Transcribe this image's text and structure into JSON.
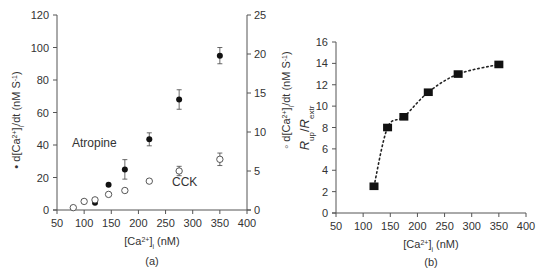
{
  "chart_data": [
    {
      "type": "scatter",
      "panel_label": "(a)",
      "title": "",
      "xlabel": "[Ca2+]i (nM)",
      "xlabel_parts": {
        "pre": "[Ca",
        "sup": "2+",
        "post": "]",
        "sub": "i",
        "unit": " (nM)"
      },
      "ylabel_left": "• d[Ca2+]i/dt (nM S-1)",
      "ylabel_left_parts": {
        "marker": "•",
        "pre": " d[Ca",
        "sup": "2+",
        "post": "]",
        "sub": "i",
        "rest": "/dt (nM S",
        "sup2": "-1",
        "end": ")"
      },
      "ylabel_right": "◦ d[Ca2+]i/dt (nM S-1)",
      "ylabel_right_parts": {
        "marker": "◦",
        "pre": " d[Ca",
        "sup": "2+",
        "post": "]",
        "sub": "i",
        "rest": "/dt (nM S",
        "sup2": "-1",
        "end": ")"
      },
      "xlim": [
        50,
        400
      ],
      "xticks": [
        "50",
        "100",
        "150",
        "200",
        "250",
        "300",
        "350",
        "400"
      ],
      "ylim_left": [
        0,
        120
      ],
      "yticks_left": [
        "0",
        "20",
        "40",
        "60",
        "80",
        "100",
        "120"
      ],
      "ylim_right": [
        0,
        25
      ],
      "yticks_right": [
        "0",
        "5",
        "10",
        "15",
        "20",
        "25"
      ],
      "grid": false,
      "annotations": [
        "Atropine",
        "CCK"
      ],
      "series": [
        {
          "name": "Atropine",
          "marker": "filled-circle",
          "axis": "left",
          "x": [
            120,
            145,
            175,
            220,
            275,
            350
          ],
          "y": [
            4.5,
            15.5,
            25,
            43.5,
            68,
            95
          ],
          "err": [
            0,
            0,
            6,
            4,
            6,
            5
          ]
        },
        {
          "name": "CCK",
          "marker": "open-circle",
          "axis": "right",
          "x": [
            80,
            100,
            120,
            145,
            175,
            220,
            275,
            350
          ],
          "y": [
            0.3,
            1.1,
            1.3,
            2.0,
            2.5,
            3.7,
            5.0,
            6.5
          ],
          "err": [
            0,
            0,
            0,
            0,
            0,
            0,
            0.6,
            0.8
          ]
        }
      ]
    },
    {
      "type": "line",
      "panel_label": "(b)",
      "title": "",
      "xlabel": "[Ca2+]i (nM)",
      "xlabel_parts": {
        "pre": "[Ca",
        "sup": "2+",
        "post": "]",
        "sub": "i",
        "unit": " (nM)"
      },
      "ylabel": "Rup/Rextr",
      "ylabel_parts": {
        "r1": "R",
        "s1": "up",
        "slash": "/",
        "r2": "R",
        "s2": "extr"
      },
      "xlim": [
        50,
        400
      ],
      "xticks": [
        "50",
        "100",
        "150",
        "200",
        "250",
        "300",
        "350",
        "400"
      ],
      "ylim": [
        0,
        16
      ],
      "yticks": [
        "0",
        "2",
        "4",
        "6",
        "8",
        "10",
        "12",
        "14",
        "16"
      ],
      "grid": false,
      "line_style": "dotted",
      "marker": "filled-square",
      "x": [
        120,
        145,
        175,
        220,
        275,
        350
      ],
      "y": [
        2.5,
        8.0,
        9.0,
        11.3,
        13.0,
        13.9
      ]
    }
  ],
  "colors": {
    "axis": "#555555",
    "marker": "#111111",
    "text": "#333333",
    "background": "#ffffff"
  }
}
